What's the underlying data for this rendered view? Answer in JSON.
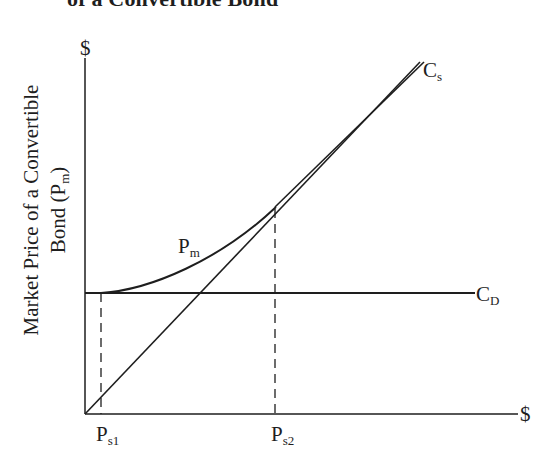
{
  "title": "of a Convertible Bond",
  "axes": {
    "y_axis_symbol": "$",
    "x_axis_symbol": "$",
    "y_label_line1": "Market Price of a Convertible",
    "y_label_line2_main": "Bond (P",
    "y_label_line2_sub": "m",
    "y_label_line2_end": ")"
  },
  "curves": {
    "cs": {
      "main": "C",
      "sub": "s"
    },
    "cd": {
      "main": "C",
      "sub": "D"
    },
    "pm": {
      "main": "P",
      "sub": "m"
    }
  },
  "x_ticks": [
    {
      "main": "P",
      "sub": "s1"
    },
    {
      "main": "P",
      "sub": "s2"
    }
  ],
  "colors": {
    "line": "#1e1e1e",
    "background": "#ffffff"
  }
}
